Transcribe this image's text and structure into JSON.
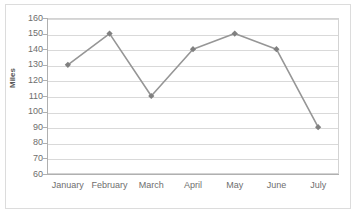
{
  "chart_data": {
    "type": "line",
    "title": "",
    "xlabel": "",
    "ylabel": "Miles",
    "categories": [
      "January",
      "February",
      "March",
      "April",
      "May",
      "June",
      "July"
    ],
    "values": [
      130,
      150,
      110,
      140,
      150,
      140,
      90
    ],
    "series": [
      {
        "name": "Miles",
        "values": [
          130,
          150,
          110,
          140,
          150,
          140,
          90
        ]
      }
    ],
    "ylim": [
      60,
      160
    ],
    "ytick_step": 10,
    "yticks": [
      160,
      150,
      140,
      130,
      120,
      110,
      100,
      90,
      80,
      70,
      60
    ],
    "ytick_labels": [
      "160",
      "150",
      "140",
      "130",
      "120",
      "110",
      "100",
      "90",
      "80",
      "70",
      "60"
    ],
    "grid": "horizontal",
    "legend": "none",
    "marker": "diamond",
    "colors": {
      "line": "#969696",
      "marker": "#808080",
      "gridline": "#d9d9d9",
      "axis": "#b0b0b0",
      "tick_text": "#6e6e6e",
      "axis_title": "#595959",
      "plot_border": "#d3d3d3",
      "outer_border": "#dcdcdc",
      "background": "#ffffff"
    }
  }
}
